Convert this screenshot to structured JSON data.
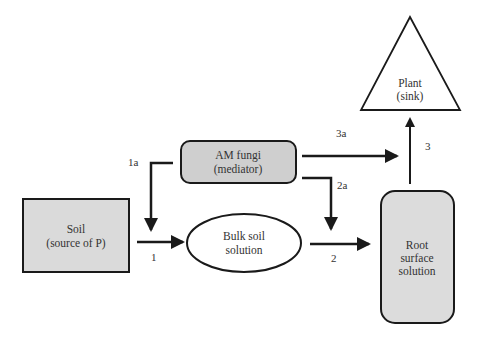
{
  "diagram": {
    "nodes": {
      "soil": {
        "line1": "Soil",
        "line2": "(source of P)",
        "shape": "rectangle",
        "fill": "#dadada"
      },
      "am_fungi": {
        "line1": "AM fungi",
        "line2": "(mediator)",
        "shape": "rounded-rectangle",
        "fill": "#cfcfcf"
      },
      "bulk_soil": {
        "line1": "Bulk soil",
        "line2": "solution",
        "shape": "ellipse",
        "fill": "#ffffff"
      },
      "root_surface": {
        "line1": "Root",
        "line2": "surface",
        "line3": "solution",
        "shape": "rounded-rectangle",
        "fill": "#dcdcdc"
      },
      "plant": {
        "line1": "Plant",
        "line2": "(sink)",
        "shape": "triangle",
        "fill": "#ffffff"
      }
    },
    "edges": [
      {
        "id": "1",
        "label": "1",
        "from": "soil",
        "to": "bulk_soil"
      },
      {
        "id": "1a",
        "label": "1a",
        "from": "am_fungi",
        "to": "bulk_soil"
      },
      {
        "id": "2",
        "label": "2",
        "from": "bulk_soil",
        "to": "root_surface"
      },
      {
        "id": "2a",
        "label": "2a",
        "from": "am_fungi",
        "to": "root_surface"
      },
      {
        "id": "3",
        "label": "3",
        "from": "root_surface",
        "to": "plant"
      },
      {
        "id": "3a",
        "label": "3a",
        "from": "am_fungi",
        "to": "plant"
      }
    ],
    "colors": {
      "stroke": "#1a1a1a",
      "text": "#333333"
    }
  }
}
